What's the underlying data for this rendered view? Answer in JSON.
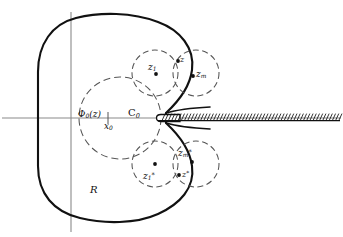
{
  "figure": {
    "colors": {
      "stroke": "#111111",
      "axis": "#8a8a8a",
      "dashed": "#555555",
      "background": "#ffffff"
    },
    "axes": {
      "horizontal_label": "real-axis",
      "vertical_label": "imaginary-axis",
      "origin_x": 71,
      "origin_y": 118
    },
    "labels": {
      "region": "R",
      "map_function": "Φ",
      "map_function_sub": "0",
      "map_function_arg": "(z)",
      "tick_point": "x",
      "tick_point_sub": "0",
      "inner_circle": "C",
      "inner_circle_sub": "0",
      "z1": "z",
      "z1_sub": "1",
      "z": "z",
      "zm": "z",
      "zm_sub": "m",
      "z1_star": "z",
      "z1_star_sub": "1",
      "z1_star_sup": "*",
      "zm_star": "z",
      "zm_star_sub": "m",
      "zm_star_sup": "*",
      "z_star": "z",
      "z_star_sup": "*"
    },
    "points": [
      {
        "name": "z1",
        "x": 156,
        "y": 74
      },
      {
        "name": "z",
        "x": 178,
        "y": 61
      },
      {
        "name": "zm",
        "x": 193,
        "y": 76
      },
      {
        "name": "z1-star",
        "x": 155,
        "y": 164
      },
      {
        "name": "zm-star",
        "x": 192,
        "y": 162
      },
      {
        "name": "z-star",
        "x": 179,
        "y": 175
      }
    ],
    "circles": [
      {
        "name": "phi0-circle",
        "cx": 120,
        "cy": 118,
        "r": 41
      },
      {
        "name": "z1-circle",
        "cx": 155,
        "cy": 73,
        "r": 23
      },
      {
        "name": "zm-circle",
        "cx": 196,
        "cy": 73,
        "r": 23
      },
      {
        "name": "z1s-circle",
        "cx": 155,
        "cy": 164,
        "r": 23
      },
      {
        "name": "zms-circle",
        "cx": 196,
        "cy": 164,
        "r": 23
      }
    ],
    "branch_cut": {
      "name": "branch-cut-slit",
      "start_x": 160,
      "end_x": 340,
      "y": 118,
      "hatch_count": 56
    }
  }
}
